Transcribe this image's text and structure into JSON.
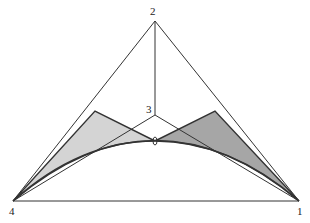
{
  "diagram": {
    "vertex_labels": {
      "v1": "1",
      "v2": "2",
      "v3": "3",
      "v4": "4"
    },
    "colors": {
      "line": "#333333",
      "light_fill": "#d4d4d4",
      "dark_fill": "#a6a6a6"
    }
  }
}
